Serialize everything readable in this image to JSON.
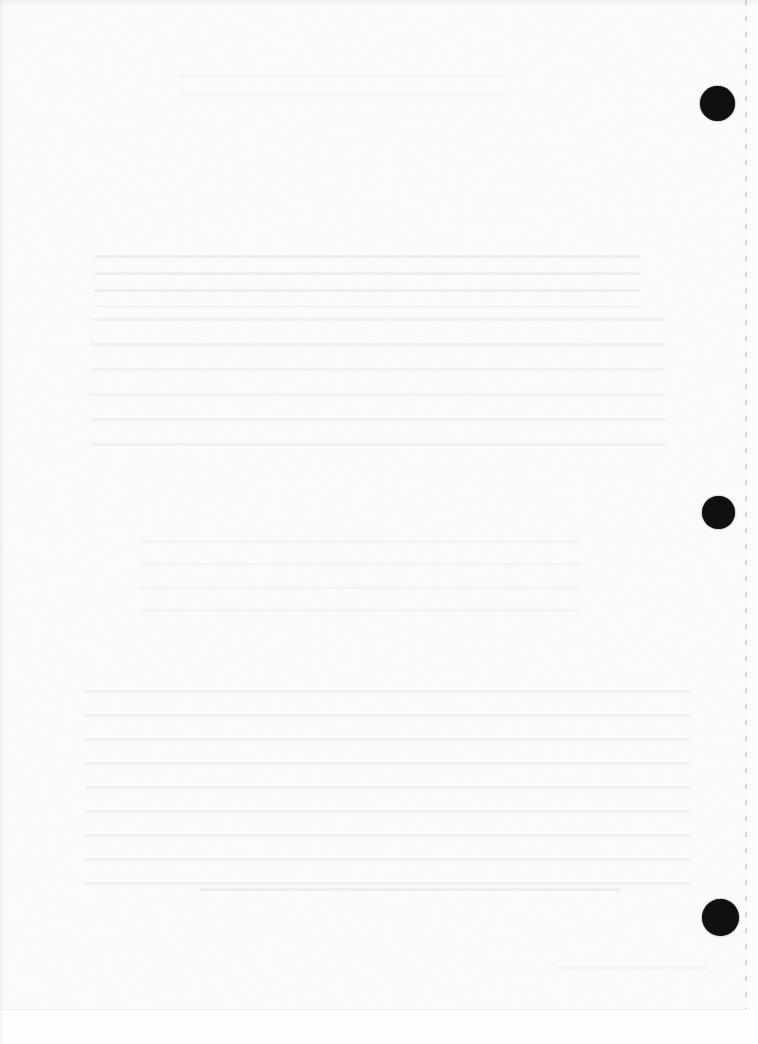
{
  "document": {
    "visible_text": "",
    "page_kind": "blank-scanned-sheet"
  },
  "colors": {
    "paper": "#fcfcfa",
    "hole": "#101010",
    "perforation": "#b5b5ae",
    "ghost_ink": "rgba(158,158,148,0.30)"
  },
  "punch_holes": [
    {
      "cx": 717,
      "cy": 103,
      "d": 35
    },
    {
      "cx": 718,
      "cy": 512,
      "d": 33
    },
    {
      "cx": 720,
      "cy": 917,
      "d": 37
    }
  ],
  "perforation_line": {
    "x": 745,
    "dash_px": 5,
    "gap_px": 11
  },
  "ghost_bands": [
    {
      "x": 180,
      "y": 75,
      "w": 330,
      "h": 38,
      "rows": 2,
      "opacity": 0.14
    },
    {
      "x": 95,
      "y": 255,
      "w": 545,
      "h": 52,
      "rows": 3,
      "opacity": 0.45
    },
    {
      "x": 90,
      "y": 318,
      "w": 575,
      "h": 150,
      "rows": 6,
      "opacity": 0.3
    },
    {
      "x": 140,
      "y": 540,
      "w": 440,
      "h": 92,
      "rows": 4,
      "opacity": 0.18
    },
    {
      "x": 85,
      "y": 690,
      "w": 605,
      "h": 215,
      "rows": 9,
      "opacity": 0.32
    },
    {
      "x": 200,
      "y": 888,
      "w": 420,
      "h": 20,
      "rows": 1,
      "opacity": 0.45
    },
    {
      "x": 558,
      "y": 966,
      "w": 150,
      "h": 24,
      "rows": 1,
      "opacity": 0.25
    }
  ],
  "bottom_strip": {
    "height": 34
  }
}
